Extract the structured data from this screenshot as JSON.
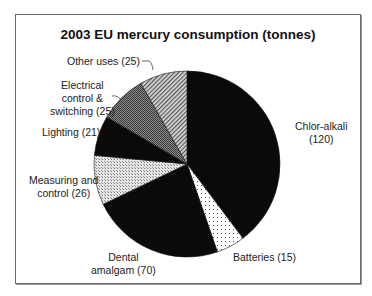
{
  "chart_data": {
    "type": "pie",
    "title": "2003 EU mercury consumption (tonnes)",
    "unit": "tonnes",
    "categories": [
      "Chlor-alkali",
      "Batteries",
      "Dental amalgam",
      "Measuring and control",
      "Lighting",
      "Electrical control & switching",
      "Other uses"
    ],
    "values": [
      120,
      15,
      70,
      26,
      21,
      25,
      25
    ],
    "labels": [
      "Chlor-alkali (120)",
      "Batteries (15)",
      "Dental amalgam (70)",
      "Measuring and control (26)",
      "Lighting (21)",
      "Electrical control & switching (25)",
      "Other uses (25)"
    ],
    "start_angle": "12 o'clock",
    "direction": "clockwise",
    "legend": "none (direct labels)"
  },
  "title": "2003 EU mercury consumption (tonnes)",
  "labels": {
    "chlor": [
      "Chlor-alkali",
      "(120)"
    ],
    "batteries": "Batteries (15)",
    "dental": [
      "Dental",
      "amalgam (70)"
    ],
    "measuring": [
      "Measuring and",
      "control (26)"
    ],
    "lighting": "Lighting (21)",
    "electrical": [
      "Electrical",
      "control &",
      "switching (25)"
    ],
    "other": "Other uses (25)"
  }
}
